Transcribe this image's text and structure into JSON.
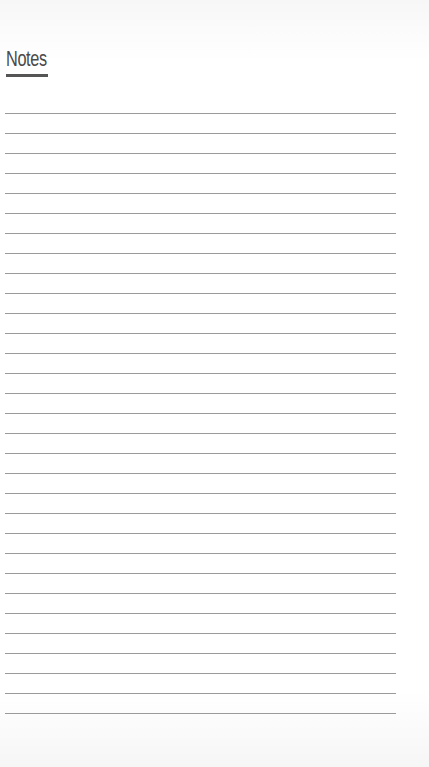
{
  "page": {
    "title": "Notes",
    "ruled_line_count": 31,
    "ruled_line_spacing_px": 20,
    "colors": {
      "title": "#4a4a4a",
      "underline": "#555555",
      "rule": "#9a9a9a",
      "background": "#ffffff"
    }
  }
}
